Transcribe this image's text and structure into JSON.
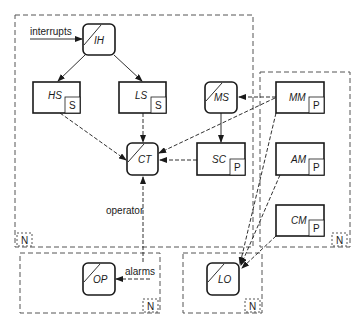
{
  "diagram": {
    "groups": [
      {
        "id": "main",
        "tag": "N"
      },
      {
        "id": "right",
        "tag": "N"
      },
      {
        "id": "op_group",
        "tag": "N"
      },
      {
        "id": "lo_group",
        "tag": "N"
      }
    ],
    "nodes": {
      "IH": {
        "label": "IH",
        "shape": "rounded-slash"
      },
      "HS": {
        "label": "HS",
        "tag": "S"
      },
      "LS": {
        "label": "LS",
        "tag": "S"
      },
      "CT": {
        "label": "CT",
        "shape": "rounded-slash"
      },
      "MS": {
        "label": "MS",
        "shape": "rounded-slash"
      },
      "SC": {
        "label": "SC",
        "tag": "P"
      },
      "MM": {
        "label": "MM",
        "tag": "P"
      },
      "AM": {
        "label": "AM",
        "tag": "P"
      },
      "CM": {
        "label": "CM",
        "tag": "P"
      },
      "OP": {
        "label": "OP",
        "shape": "rounded-slash"
      },
      "LO": {
        "label": "LO",
        "shape": "rounded-slash"
      }
    },
    "labels": {
      "interrupts": "interrupts",
      "operator": "operator",
      "alarms": "alarms"
    },
    "edges": [
      {
        "from": "interrupts",
        "to": "IH",
        "style": "solid"
      },
      {
        "from": "IH",
        "to": "HS",
        "style": "solid"
      },
      {
        "from": "IH",
        "to": "LS",
        "style": "solid"
      },
      {
        "from": "HS",
        "to": "CT",
        "style": "dashed"
      },
      {
        "from": "LS",
        "to": "CT",
        "style": "dashed"
      },
      {
        "from": "MM",
        "to": "CT",
        "style": "dashed"
      },
      {
        "from": "SC",
        "to": "CT",
        "style": "dashed"
      },
      {
        "from": "MM",
        "to": "MS",
        "style": "dashed"
      },
      {
        "from": "MS",
        "to": "SC",
        "style": "solid"
      },
      {
        "from": "OP",
        "to": "CT",
        "style": "dashed",
        "label": "operator"
      },
      {
        "from": "alarms",
        "to": "OP",
        "style": "dashed"
      },
      {
        "from": "MM",
        "to": "LO",
        "style": "dashed"
      },
      {
        "from": "AM",
        "to": "LO",
        "style": "dashed"
      },
      {
        "from": "CM",
        "to": "LO",
        "style": "dashed"
      }
    ]
  }
}
